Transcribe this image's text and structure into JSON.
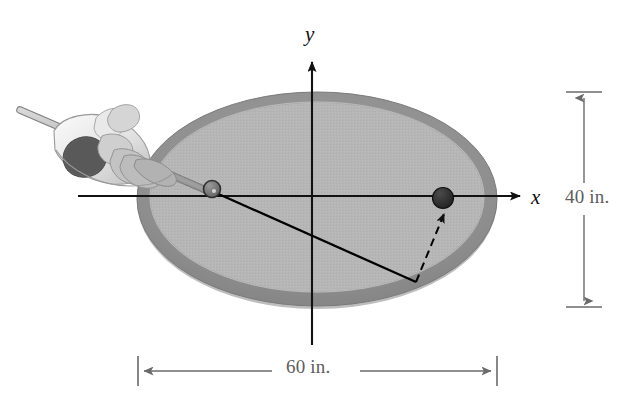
{
  "figure": {
    "kind": "elliptical-billiard-table-diagram",
    "background_color": "#ffffff"
  },
  "axes": {
    "x_label": "x",
    "y_label": "y",
    "x_axis": {
      "x1": 78,
      "y1": 196,
      "x2": 527,
      "y2": 196,
      "arrow": "right"
    },
    "y_axis": {
      "x1": 312,
      "y1": 345,
      "x2": 312,
      "y2": 55,
      "arrow": "up"
    },
    "origin": {
      "x": 312,
      "y": 196
    },
    "line_color": "#111111"
  },
  "table": {
    "name": "elliptical-pool-table",
    "center": {
      "x": 317,
      "y": 199
    },
    "outer_rx": 180,
    "outer_ry": 108,
    "inner_rx": 168,
    "inner_ry": 96,
    "rim_color": "#8f8f8f",
    "felt_color": "#b5b5b5",
    "felt_edge_color": "#a3a3a3"
  },
  "balls": [
    {
      "name": "cue-ball",
      "label": "cue ball",
      "x": 212,
      "y": 189,
      "r": 8,
      "color": "#6e6e6e",
      "outline": "#2a2a2a"
    },
    {
      "name": "target-ball",
      "label": "target ball",
      "x": 443,
      "y": 198,
      "r": 10,
      "color": "#2a2a2a",
      "outline": "#111111"
    }
  ],
  "paths": [
    {
      "name": "incoming-shot-path",
      "style": "solid",
      "from": {
        "x": 214,
        "y": 192
      },
      "to": {
        "x": 416,
        "y": 282
      },
      "color": "#000000",
      "width": 2.2
    },
    {
      "name": "reflected-shot-path",
      "style": "dashed",
      "from": {
        "x": 416,
        "y": 282
      },
      "to": {
        "x": 444,
        "y": 212
      },
      "color": "#000000",
      "width": 2.0,
      "arrow": "end"
    }
  ],
  "cue": {
    "name": "cue-stick",
    "x1": 22,
    "y1": 111,
    "x2": 206,
    "y2": 190,
    "color": "#bdbdbd",
    "outline": "#7b7b7b",
    "width": 6
  },
  "player_hand": {
    "name": "player-hand-and-arm",
    "description": "stylized grayscale hand gripping cue stick at upper left"
  },
  "dimensions": {
    "vertical": {
      "name": "table-height-dimension",
      "label": "40 in.",
      "line_x": 584,
      "y_top": 92,
      "y_bottom": 307,
      "color": "#6a6a6a"
    },
    "horizontal": {
      "name": "table-width-dimension",
      "label": "60 in.",
      "line_y": 371,
      "x_left": 138,
      "x_right": 497,
      "color": "#6a6a6a"
    }
  },
  "colors": {
    "ink": "#111111",
    "dimension_gray": "#6a6a6a",
    "felt": "#b5b5b5",
    "rim": "#8f8f8f"
  }
}
